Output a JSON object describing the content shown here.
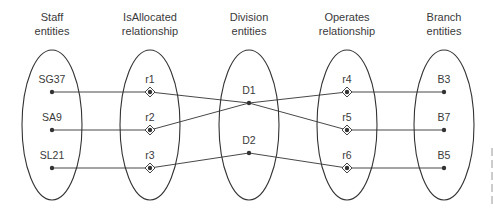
{
  "colors": {
    "stroke": "#333333",
    "text": "#3a3a3a",
    "background": "#ffffff",
    "edge_marks": "#9a9a9a"
  },
  "columns": [
    {
      "id": "staff",
      "header": [
        "Staff",
        "entities"
      ],
      "cx": 52,
      "kind": "entity",
      "items": [
        {
          "label": "SG37",
          "y": 92
        },
        {
          "label": "SA9",
          "y": 130
        },
        {
          "label": "SL21",
          "y": 168
        }
      ]
    },
    {
      "id": "isallocated",
      "header": [
        "IsAllocated",
        "relationship"
      ],
      "cx": 150,
      "kind": "relationship",
      "items": [
        {
          "label": "r1",
          "y": 92
        },
        {
          "label": "r2",
          "y": 130
        },
        {
          "label": "r3",
          "y": 168
        }
      ]
    },
    {
      "id": "division",
      "header": [
        "Division",
        "entities"
      ],
      "cx": 249,
      "kind": "entity",
      "items": [
        {
          "label": "D1",
          "y": 103
        },
        {
          "label": "D2",
          "y": 153
        }
      ]
    },
    {
      "id": "operates",
      "header": [
        "Operates",
        "relationship"
      ],
      "cx": 347,
      "kind": "relationship",
      "items": [
        {
          "label": "r4",
          "y": 92
        },
        {
          "label": "r5",
          "y": 130
        },
        {
          "label": "r6",
          "y": 168
        }
      ]
    },
    {
      "id": "branch",
      "header": [
        "Branch",
        "entities"
      ],
      "cx": 444,
      "kind": "entity",
      "items": [
        {
          "label": "B3",
          "y": 92
        },
        {
          "label": "B7",
          "y": 130
        },
        {
          "label": "B5",
          "y": 168
        }
      ]
    }
  ],
  "ellipse": {
    "cy": 125,
    "rx": 30,
    "ry": 75
  },
  "links": [
    {
      "from": "SG37",
      "to": "r1"
    },
    {
      "from": "SA9",
      "to": "r2"
    },
    {
      "from": "SL21",
      "to": "r3"
    },
    {
      "from": "r1",
      "to": "D1"
    },
    {
      "from": "r2",
      "to": "D1"
    },
    {
      "from": "r3",
      "to": "D2"
    },
    {
      "from": "D1",
      "to": "r4"
    },
    {
      "from": "D1",
      "to": "r5"
    },
    {
      "from": "D2",
      "to": "r6"
    },
    {
      "from": "r4",
      "to": "B3"
    },
    {
      "from": "r5",
      "to": "B7"
    },
    {
      "from": "r6",
      "to": "B5"
    }
  ],
  "edge_marks": [
    152,
    164,
    176,
    188,
    200
  ]
}
